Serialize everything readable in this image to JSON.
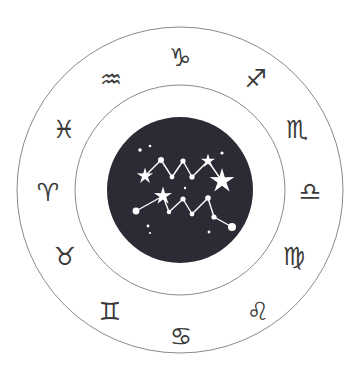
{
  "figure": {
    "background_color": "#ffffff",
    "ring_stroke_color": "#8a8a8a",
    "glyph_color": "#3a3a3a",
    "disc_color": "#2b2b35",
    "star_color": "#ffffff",
    "center_x": 180,
    "center_y": 190,
    "outer_radius": 163,
    "middle_radius": 105,
    "disc_radius": 73
  },
  "zodiac": {
    "signs": [
      {
        "name": "capricorn",
        "glyph": "♑",
        "label": "Capricorn",
        "angle_deg": 270,
        "x": 180,
        "y": 57,
        "font_size": 25
      },
      {
        "name": "aquarius",
        "glyph": "♒",
        "label": "Aquarius",
        "angle_deg": 300,
        "x": 111,
        "y": 79,
        "font_size": 25
      },
      {
        "name": "pisces",
        "glyph": "♓",
        "label": "Pisces",
        "angle_deg": 330,
        "x": 64,
        "y": 129,
        "font_size": 25
      },
      {
        "name": "aries",
        "glyph": "♈",
        "label": "Aries",
        "angle_deg": 0,
        "x": 48,
        "y": 192,
        "font_size": 25
      },
      {
        "name": "taurus",
        "glyph": "♉",
        "label": "Taurus",
        "angle_deg": 30,
        "x": 65,
        "y": 256,
        "font_size": 25
      },
      {
        "name": "gemini",
        "glyph": "♊",
        "label": "Gemini",
        "angle_deg": 60,
        "x": 110,
        "y": 311,
        "font_size": 25
      },
      {
        "name": "cancer",
        "glyph": "♋",
        "label": "Cancer",
        "angle_deg": 90,
        "x": 181,
        "y": 336,
        "font_size": 25
      },
      {
        "name": "leo",
        "glyph": "♌",
        "label": "Leo",
        "angle_deg": 120,
        "x": 258,
        "y": 311,
        "font_size": 25
      },
      {
        "name": "virgo",
        "glyph": "♍",
        "label": "Virgo",
        "angle_deg": 150,
        "x": 294,
        "y": 256,
        "font_size": 25
      },
      {
        "name": "libra",
        "glyph": "♎",
        "label": "Libra",
        "angle_deg": 180,
        "x": 310,
        "y": 191,
        "font_size": 25
      },
      {
        "name": "scorpio",
        "glyph": "♏",
        "label": "Scorpio",
        "angle_deg": 210,
        "x": 297,
        "y": 129,
        "font_size": 25
      },
      {
        "name": "sagittarius",
        "glyph": "♐",
        "label": "Sagittarius",
        "angle_deg": 240,
        "x": 256,
        "y": 78,
        "font_size": 25
      }
    ]
  },
  "constellation": {
    "name": "aquarius-constellation",
    "label": "Aquarius",
    "stars": [
      {
        "id": "s1",
        "x": 145,
        "y": 176,
        "r": 0,
        "type": "sparkle",
        "size": 8.5
      },
      {
        "id": "s2",
        "x": 161,
        "y": 160,
        "r": 3.0,
        "type": "dot"
      },
      {
        "id": "s3",
        "x": 172,
        "y": 177,
        "r": 2.4,
        "type": "dot"
      },
      {
        "id": "s4",
        "x": 183,
        "y": 161,
        "r": 2.6,
        "type": "dot"
      },
      {
        "id": "s5",
        "x": 192,
        "y": 177,
        "r": 2.6,
        "type": "dot"
      },
      {
        "id": "s6",
        "x": 208,
        "y": 161,
        "r": 0,
        "type": "sparkle",
        "size": 7.5
      },
      {
        "id": "s7",
        "x": 222,
        "y": 181,
        "r": 0,
        "type": "sparkle",
        "size": 13
      },
      {
        "id": "s8",
        "x": 163,
        "y": 196,
        "r": 0,
        "type": "sparkle",
        "size": 9.5
      },
      {
        "id": "s9",
        "x": 136,
        "y": 211,
        "r": 3.4,
        "type": "dot"
      },
      {
        "id": "s10",
        "x": 169,
        "y": 212,
        "r": 2.2,
        "type": "dot"
      },
      {
        "id": "s11",
        "x": 183,
        "y": 199,
        "r": 2.6,
        "type": "dot"
      },
      {
        "id": "s12",
        "x": 192,
        "y": 214,
        "r": 2.4,
        "type": "dot"
      },
      {
        "id": "s13",
        "x": 208,
        "y": 198,
        "r": 2.8,
        "type": "dot"
      },
      {
        "id": "s14",
        "x": 214,
        "y": 217,
        "r": 2.6,
        "type": "dot"
      },
      {
        "id": "s15",
        "x": 232,
        "y": 227,
        "r": 4.0,
        "type": "dot"
      },
      {
        "id": "s16",
        "x": 140,
        "y": 150,
        "r": 1.8,
        "type": "dot"
      },
      {
        "id": "s17",
        "x": 150,
        "y": 146,
        "r": 1.3,
        "type": "dot"
      },
      {
        "id": "s18",
        "x": 222,
        "y": 153,
        "r": 1.6,
        "type": "dot"
      },
      {
        "id": "s19",
        "x": 185,
        "y": 188,
        "r": 1.2,
        "type": "dot"
      },
      {
        "id": "s20",
        "x": 148,
        "y": 226,
        "r": 1.4,
        "type": "dot"
      },
      {
        "id": "s21",
        "x": 150,
        "y": 233,
        "r": 1.1,
        "type": "dot"
      },
      {
        "id": "s22",
        "x": 209,
        "y": 232,
        "r": 1.4,
        "type": "dot"
      }
    ],
    "lines": [
      {
        "from": "s1",
        "to": "s2"
      },
      {
        "from": "s2",
        "to": "s3"
      },
      {
        "from": "s3",
        "to": "s4"
      },
      {
        "from": "s4",
        "to": "s5"
      },
      {
        "from": "s5",
        "to": "s6"
      },
      {
        "from": "s6",
        "to": "s7"
      },
      {
        "from": "s9",
        "to": "s8"
      },
      {
        "from": "s8",
        "to": "s10"
      },
      {
        "from": "s10",
        "to": "s11"
      },
      {
        "from": "s11",
        "to": "s12"
      },
      {
        "from": "s12",
        "to": "s13"
      },
      {
        "from": "s13",
        "to": "s14"
      },
      {
        "from": "s14",
        "to": "s15"
      }
    ]
  }
}
